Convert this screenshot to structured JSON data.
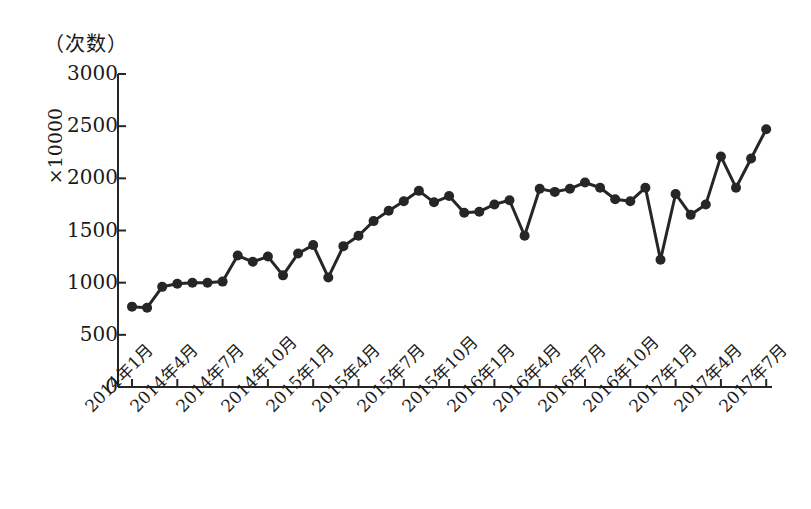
{
  "figure": {
    "unit_caption": "（次数）",
    "y_axis_unit": "×10000"
  },
  "chart_data": {
    "type": "line",
    "title": "",
    "subtitle": "",
    "xlabel": "",
    "ylabel": "（次数）",
    "y_unit_multiplier": "×10000",
    "grid": false,
    "legend": null,
    "marker": "filled-circle",
    "line_color": "#262626",
    "marker_color": "#262626",
    "ylim": [
      0,
      3000
    ],
    "ytick_labels": [
      "3000",
      "2500",
      "2000",
      "1500",
      "1000",
      "500",
      "0"
    ],
    "yticks": [
      3000,
      2500,
      2000,
      1500,
      1000,
      500,
      0
    ],
    "xtick_labels": [
      "2014年1月",
      "2014年4月",
      "2014年7月",
      "2014年10月",
      "2015年1月",
      "2015年4月",
      "2015年7月",
      "2015年10月",
      "2016年1月",
      "2016年4月",
      "2016年7月",
      "2016年10月",
      "2017年1月",
      "2017年4月",
      "2017年7月"
    ],
    "xtick_months": [
      "2014-01",
      "2014-04",
      "2014-07",
      "2014-10",
      "2015-01",
      "2015-04",
      "2015-07",
      "2015-10",
      "2016-01",
      "2016-04",
      "2016-07",
      "2016-10",
      "2017-01",
      "2017-04",
      "2017-07"
    ],
    "x": [
      "2014-01",
      "2014-02",
      "2014-03",
      "2014-04",
      "2014-05",
      "2014-06",
      "2014-07",
      "2014-08",
      "2014-09",
      "2014-10",
      "2014-11",
      "2014-12",
      "2015-01",
      "2015-02",
      "2015-03",
      "2015-04",
      "2015-05",
      "2015-06",
      "2015-07",
      "2015-08",
      "2015-09",
      "2015-10",
      "2015-11",
      "2015-12",
      "2016-01",
      "2016-02",
      "2016-03",
      "2016-04",
      "2016-05",
      "2016-06",
      "2016-07",
      "2016-08",
      "2016-09",
      "2016-10",
      "2016-11",
      "2016-12",
      "2017-01",
      "2017-02",
      "2017-03",
      "2017-04",
      "2017-05",
      "2017-06",
      "2017-07"
    ],
    "values": [
      770,
      760,
      960,
      990,
      1000,
      1000,
      1010,
      1260,
      1200,
      1250,
      1070,
      1280,
      1360,
      1050,
      1350,
      1450,
      1590,
      1690,
      1780,
      1880,
      1770,
      1830,
      1670,
      1680,
      1750,
      1790,
      1450,
      1900,
      1870,
      1900,
      1960,
      1910,
      1800,
      1780,
      1910,
      1220,
      1850,
      1650,
      1750,
      2210,
      1910,
      2190,
      2470
    ]
  }
}
